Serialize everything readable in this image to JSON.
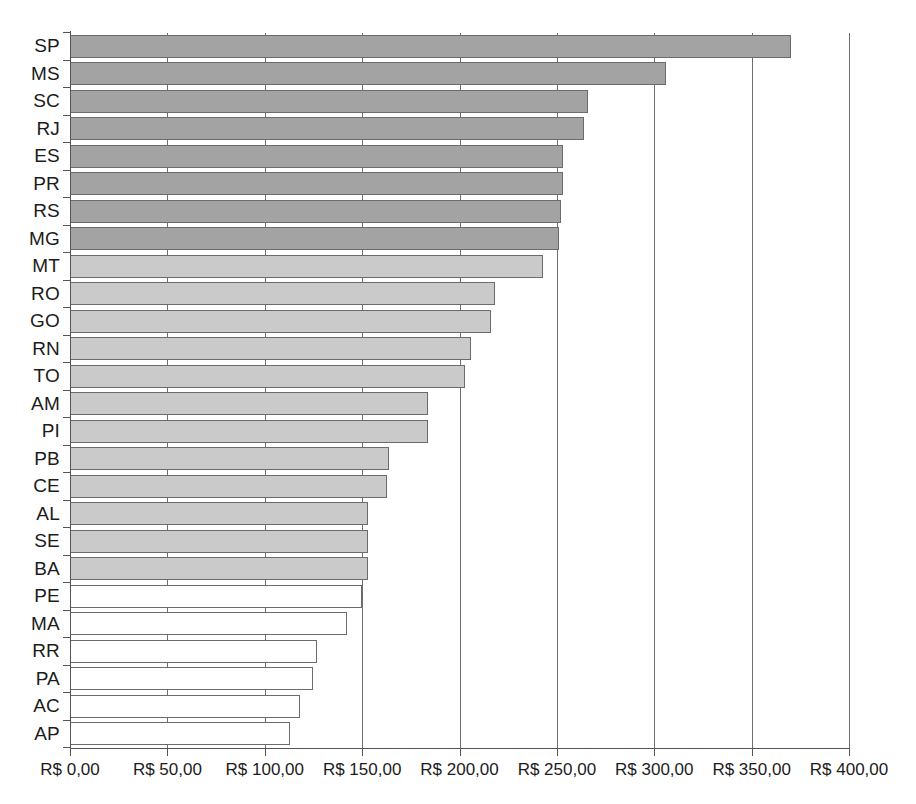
{
  "chart_data": {
    "type": "bar",
    "orientation": "horizontal",
    "title": "",
    "subtitle": "",
    "xlabel": "",
    "ylabel": "",
    "xlim": [
      0,
      400
    ],
    "grid": true,
    "legend": null,
    "currency_prefix": "R$",
    "decimal_separator": ",",
    "xtick_labels": [
      "R$ 0,00",
      "R$ 50,00",
      "R$ 100,00",
      "R$ 150,00",
      "R$ 200,00",
      "R$ 250,00",
      "R$ 300,00",
      "R$ 350,00",
      "R$ 400,00"
    ],
    "xtick_values": [
      0,
      50,
      100,
      150,
      200,
      250,
      300,
      350,
      400
    ],
    "categories": [
      "SP",
      "MS",
      "SC",
      "RJ",
      "ES",
      "PR",
      "RS",
      "MG",
      "MT",
      "RO",
      "GO",
      "RN",
      "TO",
      "AM",
      "PI",
      "PB",
      "CE",
      "AL",
      "SE",
      "BA",
      "PE",
      "MA",
      "RR",
      "PA",
      "AC",
      "AP"
    ],
    "values": [
      370,
      306,
      266,
      264,
      253,
      253,
      252,
      251,
      243,
      218,
      216,
      206,
      203,
      184,
      184,
      164,
      163,
      153,
      153,
      153,
      150,
      142,
      127,
      125,
      118,
      113
    ],
    "bar_groups": [
      "dark",
      "dark",
      "dark",
      "dark",
      "dark",
      "dark",
      "dark",
      "dark",
      "light",
      "light",
      "light",
      "light",
      "light",
      "light",
      "light",
      "light",
      "light",
      "light",
      "light",
      "light",
      "white",
      "white",
      "white",
      "white",
      "white",
      "white"
    ],
    "colors": {
      "dark": "#a3a3a3",
      "light": "#cacaca",
      "white": "#ffffff",
      "bar_border": "#6b6b6b",
      "gridline": "#6e6e6e",
      "axis": "#555555",
      "text": "#1c1c1c",
      "background": "#ffffff"
    }
  }
}
